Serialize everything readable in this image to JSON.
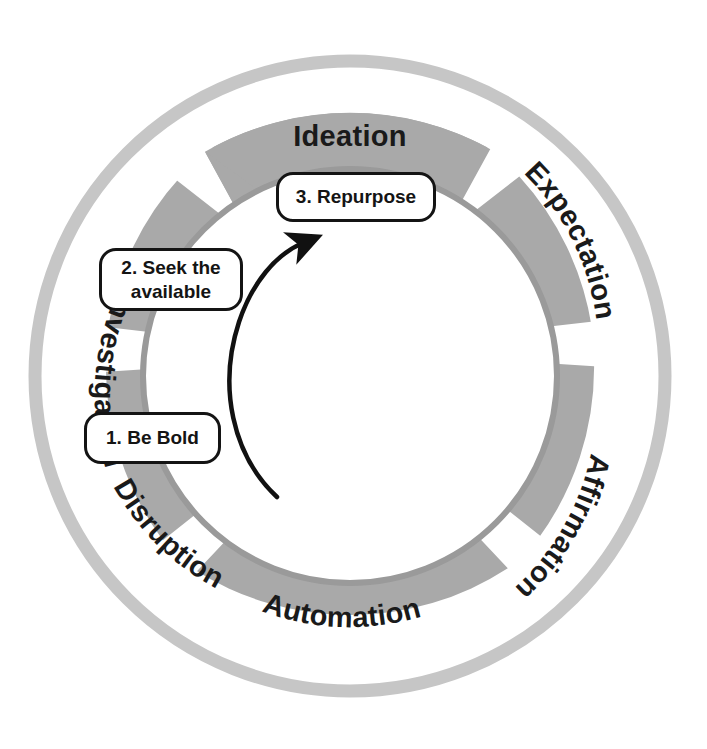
{
  "diagram": {
    "type": "cycle-wheel",
    "title": "",
    "colors": {
      "outer_ring": "#c6c6c6",
      "segment_fill": "#a9a9a9",
      "inner_circle_stroke": "#9a9a9a",
      "gap": "#ffffff",
      "text": "#1a1a1a",
      "callout_border": "#141414",
      "callout_fill": "#ffffff",
      "arrow": "#111111"
    },
    "segments": [
      {
        "id": "ideation",
        "label": "Ideation"
      },
      {
        "id": "expectation",
        "label": "Expectation"
      },
      {
        "id": "affirmation",
        "label": "Affirmation"
      },
      {
        "id": "automation",
        "label": "Automation"
      },
      {
        "id": "disruption",
        "label": "Disruption"
      },
      {
        "id": "investigation",
        "label": "Investigation"
      }
    ],
    "callouts": [
      {
        "id": "repurpose",
        "label": "3. Repurpose"
      },
      {
        "id": "seek",
        "label": "2. Seek the\navailable"
      },
      {
        "id": "bold",
        "label": "1. Be Bold"
      }
    ],
    "arrow": {
      "name": "curved-cycle-arrow",
      "direction": "counterclockwise"
    }
  }
}
